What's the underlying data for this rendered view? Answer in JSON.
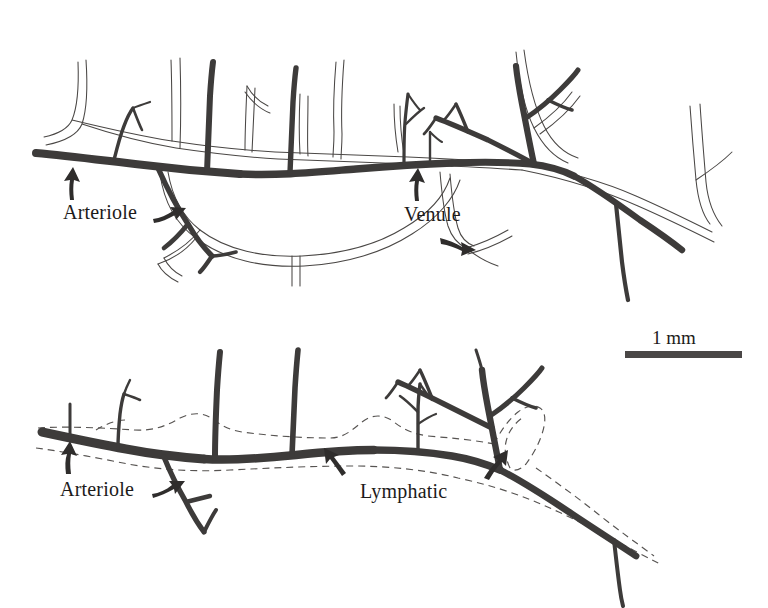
{
  "figure": {
    "type": "scientific-line-drawing",
    "background_color": "#ffffff",
    "ink_color": "#3d3b3a",
    "panels": [
      {
        "id": "top-panel",
        "name": "arteriole-venule-pair",
        "labels": [
          {
            "id": "arteriole-top",
            "text": "Arteriole",
            "x": 63,
            "y": 202,
            "arrows": [
              "up-curved",
              "right-curved"
            ]
          },
          {
            "id": "venule-top",
            "text": "Venule",
            "x": 404,
            "y": 204,
            "arrows": [
              "up-curved",
              "right-curved"
            ]
          }
        ]
      },
      {
        "id": "bottom-panel",
        "name": "arteriole-lymphatic-pair",
        "labels": [
          {
            "id": "arteriole-bottom",
            "text": "Arteriole",
            "x": 60,
            "y": 479,
            "arrows": [
              "up-curved",
              "right-curved"
            ]
          },
          {
            "id": "lymphatic-bottom",
            "text": "Lymphatic",
            "x": 360,
            "y": 481,
            "arrows": [
              "up-left-curved",
              "up-right-curved"
            ]
          }
        ]
      }
    ],
    "scale_bar": {
      "label": "1 mm",
      "label_x": 652,
      "label_y": 328,
      "bar_x": 625,
      "bar_y": 351,
      "bar_width": 117,
      "bar_height": 7,
      "color": "#4a4746"
    },
    "legend_keys": [
      {
        "name": "arteriole",
        "style": "solid thick dark line"
      },
      {
        "name": "venule",
        "style": "thin double outline"
      },
      {
        "name": "lymphatic",
        "style": "dashed thin line"
      }
    ]
  }
}
